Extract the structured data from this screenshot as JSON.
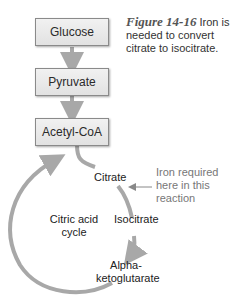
{
  "caption": {
    "figure_label": "Figure 14-16",
    "text": "Iron is needed to convert citrate to isocitrate."
  },
  "boxes": [
    {
      "label": "Glucose"
    },
    {
      "label": "Pyruvate"
    },
    {
      "label": "Acetyl-CoA"
    }
  ],
  "cycle": {
    "center_label_line1": "Citric acid",
    "center_label_line2": "cycle",
    "citrate": "Citrate",
    "isocitrate": "Isocitrate",
    "alpha_line1": "Alpha-",
    "alpha_line2": "ketoglutarate"
  },
  "annotation": {
    "line1": "Iron required",
    "line2": "here in this",
    "line3": "reaction"
  },
  "colors": {
    "arrow": "#a8a8a8",
    "box_border": "#8a8a8a",
    "note_text": "#777777"
  }
}
